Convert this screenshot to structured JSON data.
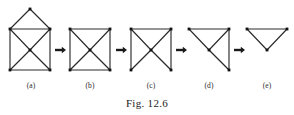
{
  "figure": {
    "caption": "Fig. 12.6",
    "caption_x": 147,
    "caption_y": 97,
    "width": 294,
    "height": 115,
    "background_color": "#ffffff",
    "edge_color": "#2b2b2b",
    "vertex_color": "#111111",
    "arrow_color": "#1a1a1a",
    "label_color": "#2b2b2b"
  },
  "panels": [
    {
      "id": "panel-a",
      "label": "(a)",
      "label_x": 31,
      "label_y": 81,
      "description": "house graph: apex over square with both diagonals and center vertex",
      "vertices": [
        {
          "name": "apex",
          "x": 30,
          "y": 9
        },
        {
          "name": "upper-left",
          "x": 10,
          "y": 29
        },
        {
          "name": "upper-right",
          "x": 50,
          "y": 29
        },
        {
          "name": "center",
          "x": 30,
          "y": 50
        },
        {
          "name": "lower-left",
          "x": 10,
          "y": 70
        },
        {
          "name": "lower-right",
          "x": 50,
          "y": 70
        }
      ],
      "edges": [
        [
          "apex",
          "upper-left"
        ],
        [
          "apex",
          "upper-right"
        ],
        [
          "upper-left",
          "upper-right"
        ],
        [
          "upper-left",
          "lower-left"
        ],
        [
          "upper-right",
          "lower-right"
        ],
        [
          "lower-left",
          "lower-right"
        ],
        [
          "upper-left",
          "center"
        ],
        [
          "upper-right",
          "center"
        ],
        [
          "lower-left",
          "center"
        ],
        [
          "lower-right",
          "center"
        ]
      ]
    },
    {
      "id": "panel-b",
      "label": "(b)",
      "label_x": 90,
      "label_y": 81,
      "description": "square with both diagonals and center vertex",
      "vertices": [
        {
          "name": "upper-left",
          "x": 70,
          "y": 29
        },
        {
          "name": "upper-right",
          "x": 110,
          "y": 29
        },
        {
          "name": "center",
          "x": 90,
          "y": 50
        },
        {
          "name": "lower-left",
          "x": 70,
          "y": 70
        },
        {
          "name": "lower-right",
          "x": 110,
          "y": 70
        }
      ],
      "edges": [
        [
          "upper-left",
          "upper-right"
        ],
        [
          "upper-left",
          "lower-left"
        ],
        [
          "upper-right",
          "lower-right"
        ],
        [
          "lower-left",
          "lower-right"
        ],
        [
          "upper-left",
          "center"
        ],
        [
          "upper-right",
          "center"
        ],
        [
          "lower-left",
          "center"
        ],
        [
          "lower-right",
          "center"
        ]
      ]
    },
    {
      "id": "panel-c",
      "label": "(c)",
      "label_x": 151,
      "label_y": 81,
      "description": "square missing bottom edge, both diagonals and center vertex",
      "vertices": [
        {
          "name": "upper-left",
          "x": 131,
          "y": 29
        },
        {
          "name": "upper-right",
          "x": 171,
          "y": 29
        },
        {
          "name": "center",
          "x": 151,
          "y": 50
        },
        {
          "name": "lower-left",
          "x": 131,
          "y": 70
        },
        {
          "name": "lower-right",
          "x": 171,
          "y": 70
        }
      ],
      "edges": [
        [
          "upper-left",
          "upper-right"
        ],
        [
          "upper-left",
          "lower-left"
        ],
        [
          "upper-right",
          "lower-right"
        ],
        [
          "upper-left",
          "center"
        ],
        [
          "upper-right",
          "center"
        ],
        [
          "lower-left",
          "center"
        ],
        [
          "lower-right",
          "center"
        ]
      ]
    },
    {
      "id": "panel-d",
      "label": "(d)",
      "label_x": 209,
      "label_y": 81,
      "description": "four vertices: top edge, right edge and spokes to center",
      "vertices": [
        {
          "name": "upper-left",
          "x": 189,
          "y": 29
        },
        {
          "name": "upper-right",
          "x": 229,
          "y": 29
        },
        {
          "name": "center",
          "x": 209,
          "y": 50
        },
        {
          "name": "lower-right",
          "x": 229,
          "y": 70
        }
      ],
      "edges": [
        [
          "upper-left",
          "upper-right"
        ],
        [
          "upper-right",
          "lower-right"
        ],
        [
          "upper-left",
          "center"
        ],
        [
          "upper-right",
          "center"
        ],
        [
          "lower-right",
          "center"
        ]
      ]
    },
    {
      "id": "panel-e",
      "label": "(e)",
      "label_x": 267,
      "label_y": 81,
      "description": "triangle with two top vertices and one bottom center vertex",
      "vertices": [
        {
          "name": "upper-left",
          "x": 247,
          "y": 29
        },
        {
          "name": "upper-right",
          "x": 287,
          "y": 29
        },
        {
          "name": "center",
          "x": 267,
          "y": 50
        }
      ],
      "edges": [
        [
          "upper-left",
          "upper-right"
        ],
        [
          "upper-left",
          "center"
        ],
        [
          "upper-right",
          "center"
        ]
      ]
    }
  ],
  "arrows": [
    {
      "id": "arrow-a-b",
      "from": "panel-a",
      "to": "panel-b",
      "x": 55,
      "y": 50,
      "length": 11
    },
    {
      "id": "arrow-b-c",
      "from": "panel-b",
      "to": "panel-c",
      "x": 116,
      "y": 50,
      "length": 11
    },
    {
      "id": "arrow-c-d",
      "from": "panel-c",
      "to": "panel-d",
      "x": 176,
      "y": 50,
      "length": 11
    },
    {
      "id": "arrow-d-e",
      "from": "panel-d",
      "to": "panel-e",
      "x": 234,
      "y": 50,
      "length": 11
    }
  ]
}
